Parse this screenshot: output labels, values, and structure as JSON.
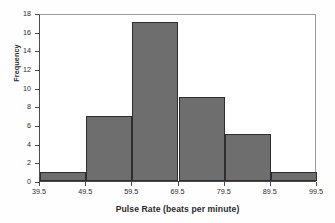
{
  "chart_data": {
    "type": "bar",
    "title": "",
    "subtitle": "",
    "xlabel": "Pulse Rate (beats per minute)",
    "ylabel": "Frequency",
    "bin_edges": [
      39.5,
      49.5,
      59.5,
      69.5,
      79.5,
      89.5,
      99.5
    ],
    "bin_width": 10,
    "categories": [
      "39.5-49.5",
      "49.5-59.5",
      "59.5-69.5",
      "69.5-79.5",
      "79.5-89.5",
      "89.5-99.5"
    ],
    "values": [
      1,
      7,
      17,
      9,
      5,
      1
    ],
    "xlim": [
      39.5,
      99.5
    ],
    "ylim": [
      0,
      18
    ],
    "x_ticks": [
      "39.5",
      "49.5",
      "59.5",
      "69.5",
      "79.5",
      "89.5",
      "99.5"
    ],
    "x_tick_values": [
      39.5,
      49.5,
      59.5,
      69.5,
      79.5,
      89.5,
      99.5
    ],
    "y_ticks": [
      "0",
      "2",
      "4",
      "6",
      "8",
      "10",
      "12",
      "14",
      "16",
      "18"
    ],
    "y_tick_values": [
      0,
      2,
      4,
      6,
      8,
      10,
      12,
      14,
      16,
      18
    ],
    "grid": false,
    "legend": false,
    "legend_position": "none",
    "annotations": [],
    "colors": {
      "bar_fill": "#6e6e6e",
      "bar_border": "#2e2e2e",
      "axis": "#4a4a4a",
      "frame": "#9a9a9a",
      "text": "#2b2b2b",
      "background": "#fefefe",
      "plot_background": "#ffffff"
    }
  }
}
